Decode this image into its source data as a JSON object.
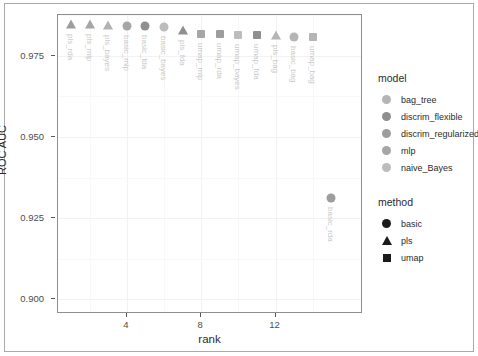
{
  "chart_data": {
    "type": "scatter",
    "title": "",
    "xlabel": "rank",
    "ylabel": "ROC AUC",
    "xlim": [
      0.3,
      16.7
    ],
    "ylim": [
      0.8955,
      0.9875
    ],
    "xticks": [
      4,
      8,
      12
    ],
    "xtick_labels": [
      "4",
      "8",
      "12"
    ],
    "yticks": [
      0.9,
      0.925,
      0.95,
      0.975
    ],
    "ytick_labels": [
      "0.900",
      "0.925",
      "0.950",
      "0.975"
    ],
    "grid": true,
    "legend_position": "right",
    "points": [
      {
        "rank": 1,
        "roc_auc": 0.9843,
        "label": "pls_rda",
        "method": "pls",
        "model": "discrim_regularized",
        "color": "#9d9d9d"
      },
      {
        "rank": 2,
        "roc_auc": 0.9843,
        "label": "pls_mlp",
        "method": "pls",
        "model": "mlp",
        "color": "#a6a6a6"
      },
      {
        "rank": 3,
        "roc_auc": 0.9842,
        "label": "pls_bayes",
        "method": "pls",
        "model": "naive_Bayes",
        "color": "#b2b2b2"
      },
      {
        "rank": 4,
        "roc_auc": 0.9841,
        "label": "basic_mlp",
        "method": "basic",
        "model": "mlp",
        "color": "#a6a6a6"
      },
      {
        "rank": 5,
        "roc_auc": 0.984,
        "label": "basic_fda",
        "method": "basic",
        "model": "discrim_flexible",
        "color": "#8f8f8f"
      },
      {
        "rank": 6,
        "roc_auc": 0.9838,
        "label": "basic_bayes",
        "method": "basic",
        "model": "naive_Bayes",
        "color": "#bcbcbc"
      },
      {
        "rank": 7,
        "roc_auc": 0.9825,
        "label": "pls_fda",
        "method": "pls",
        "model": "discrim_flexible",
        "color": "#8f8f8f"
      },
      {
        "rank": 8,
        "roc_auc": 0.9818,
        "label": "umap_mlp",
        "method": "umap",
        "model": "mlp",
        "color": "#a6a6a6"
      },
      {
        "rank": 9,
        "roc_auc": 0.9817,
        "label": "umap_rda",
        "method": "umap",
        "model": "discrim_regularized",
        "color": "#9d9d9d"
      },
      {
        "rank": 10,
        "roc_auc": 0.9814,
        "label": "umap_bayes",
        "method": "umap",
        "model": "naive_Bayes",
        "color": "#bcbcbc"
      },
      {
        "rank": 11,
        "roc_auc": 0.9814,
        "label": "umap_fda",
        "method": "umap",
        "model": "discrim_flexible",
        "color": "#8f8f8f"
      },
      {
        "rank": 12,
        "roc_auc": 0.981,
        "label": "pls_bag",
        "method": "pls",
        "model": "bag_tree",
        "color": "#b5b5b5"
      },
      {
        "rank": 13,
        "roc_auc": 0.9808,
        "label": "basic_bag",
        "method": "basic",
        "model": "bag_tree",
        "color": "#b5b5b5"
      },
      {
        "rank": 14,
        "roc_auc": 0.9806,
        "label": "umap_bag",
        "method": "umap",
        "model": "bag_tree",
        "color": "#b5b5b5"
      },
      {
        "rank": 15,
        "roc_auc": 0.9312,
        "label": "basic_rda",
        "method": "basic",
        "model": "discrim_regularized",
        "color": "#9d9d9d"
      }
    ]
  },
  "legends": {
    "model": {
      "title": "model",
      "shape": "circle",
      "items": [
        {
          "label": "bag_tree",
          "color": "#b5b5b5"
        },
        {
          "label": "discrim_flexible",
          "color": "#8f8f8f"
        },
        {
          "label": "discrim_regularized",
          "color": "#9d9d9d"
        },
        {
          "label": "mlp",
          "color": "#a6a6a6"
        },
        {
          "label": "naive_Bayes",
          "color": "#bcbcbc"
        }
      ]
    },
    "method": {
      "title": "method",
      "color": "#1a1a1a",
      "items": [
        {
          "label": "basic",
          "shape": "circle"
        },
        {
          "label": "pls",
          "shape": "triangle"
        },
        {
          "label": "umap",
          "shape": "square"
        }
      ]
    }
  }
}
